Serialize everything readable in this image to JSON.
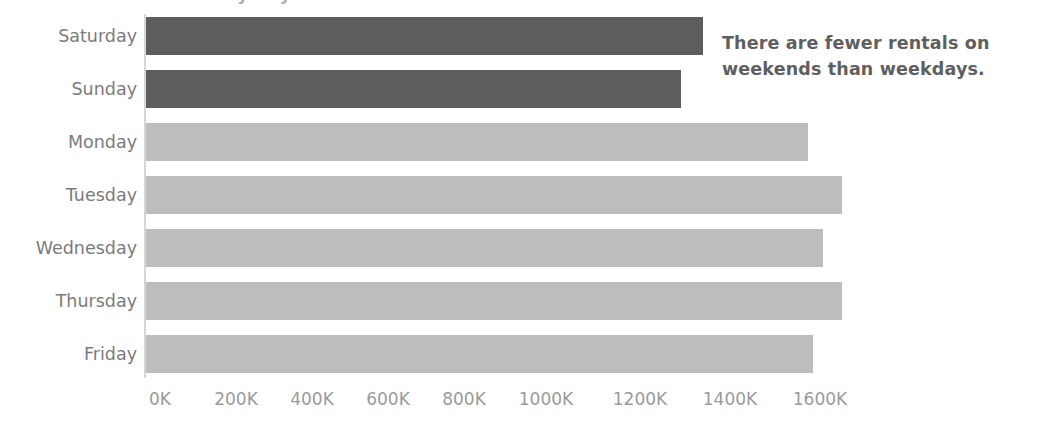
{
  "chart_data": {
    "type": "bar",
    "orientation": "horizontal",
    "title": "Rentals by Day of Week",
    "xlabel": "",
    "ylabel": "",
    "categories": [
      "Saturday",
      "Sunday",
      "Monday",
      "Tuesday",
      "Wednesday",
      "Thursday",
      "Friday"
    ],
    "values": [
      1284000,
      1233000,
      1526000,
      1604000,
      1560000,
      1604000,
      1537000
    ],
    "value_labels": [
      "1284K",
      "1233K",
      "1526K",
      "1604K",
      "1560K",
      "1604K",
      "1537K"
    ],
    "series": [
      {
        "name": "Rentals",
        "values": [
          1284000,
          1233000,
          1526000,
          1604000,
          1560000,
          1604000,
          1537000
        ]
      }
    ],
    "highlight_categories": [
      "Saturday",
      "Sunday"
    ],
    "xlim": [
      0,
      1600000
    ],
    "xticks": [
      0,
      200000,
      400000,
      600000,
      800000,
      1000000,
      1200000,
      1400000,
      1600000
    ],
    "xtick_labels": [
      "0K",
      "200K",
      "400K",
      "600K",
      "800K",
      "1000K",
      "1200K",
      "1400K",
      "1600K"
    ],
    "grid": false,
    "legend": false,
    "legend_position": "none",
    "colors": {
      "bar_default": "#bdbdbd",
      "bar_highlight": "#5d5d5d",
      "axis": "#d6d6d6",
      "category_label": "#7b7b7b",
      "tick_label": "#9a9a9a",
      "annotation_text": "#5f5f5f",
      "background": "#ffffff"
    },
    "annotations": [
      {
        "name": "weekend-callout",
        "text": "There are fewer rentals on weekends than weekdays."
      }
    ]
  },
  "annotation": {
    "line1": "There are fewer rentals on",
    "line2": "weekends than weekdays.",
    "full": "There are fewer rentals on weekends than weekdays."
  },
  "axis": {
    "categories": [
      "Saturday",
      "Sunday",
      "Monday",
      "Tuesday",
      "Wednesday",
      "Thursday",
      "Friday"
    ],
    "xtick_labels": [
      "0K",
      "200K",
      "400K",
      "600K",
      "800K",
      "1000K",
      "1200K",
      "1400K",
      "1600K"
    ]
  },
  "title_remnant": "Rentals by Day of Week"
}
